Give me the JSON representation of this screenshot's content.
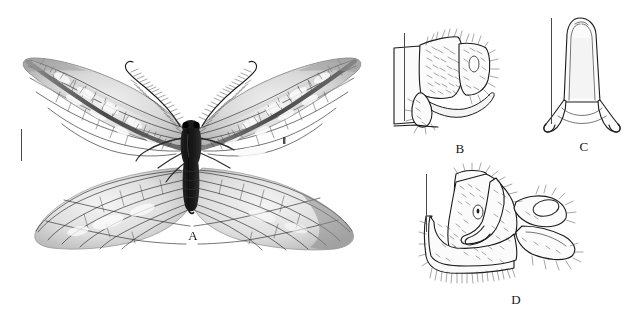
{
  "figure": {
    "background_color": "#ffffff",
    "ink_color": "#1b1b1b",
    "scale_bar_color": "#4a4a4a",
    "panels": [
      {
        "id": "A",
        "label": "A",
        "subject": "adult-moth-specimen-dorsal-habitus",
        "type": "halftone-photograph",
        "has_scale_bar": true,
        "description": "Pinned adult moth, wings spread, bipectinate antennae, dark thorax and abdomen, translucent veined fore- and hindwings"
      },
      {
        "id": "B",
        "label": "B",
        "subject": "male-genitalia-lateral-view",
        "type": "line-drawing",
        "has_scale_bar": true,
        "description": "Lateral view of terminal abdominal segments with setose valve and gonostylus"
      },
      {
        "id": "C",
        "label": "C",
        "subject": "aedeagus-ventral-view",
        "type": "line-drawing",
        "has_scale_bar": true,
        "description": "Elongate tongue-shaped sclerite with flared basal arms"
      },
      {
        "id": "D",
        "label": "D",
        "subject": "male-genitalia-caudolateral-view",
        "type": "line-drawing",
        "has_scale_bar": true,
        "description": "Setose tergite, sclerotised plate and paired clasping processes"
      }
    ]
  }
}
